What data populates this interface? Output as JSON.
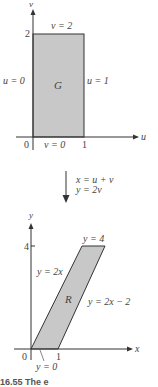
{
  "top_diagram": {
    "axis_v_label": "v",
    "axis_u_label": "u",
    "tick_v_2": "2",
    "tick_u_0": "0",
    "tick_u_1": "1",
    "top_edge_label": "v = 2",
    "left_edge_label": "u = 0",
    "right_edge_label": "u = 1",
    "bottom_edge_label": "v = 0",
    "region_label": "G",
    "fill_color": "#c8c8c8"
  },
  "transformation": {
    "line1": "x = u + v",
    "line2": "y = 2v"
  },
  "bottom_diagram": {
    "axis_y_label": "y",
    "axis_x_label": "x",
    "tick_y_4": "4",
    "tick_x_0": "0",
    "tick_x_1": "1",
    "top_edge_label": "y = 4",
    "left_edge_label": "y = 2x",
    "right_edge_label": "y = 2x − 2",
    "bottom_edge_label": "y = 0",
    "region_label": "R",
    "fill_color": "#c8c8c8"
  },
  "caption": "16.55  The e"
}
